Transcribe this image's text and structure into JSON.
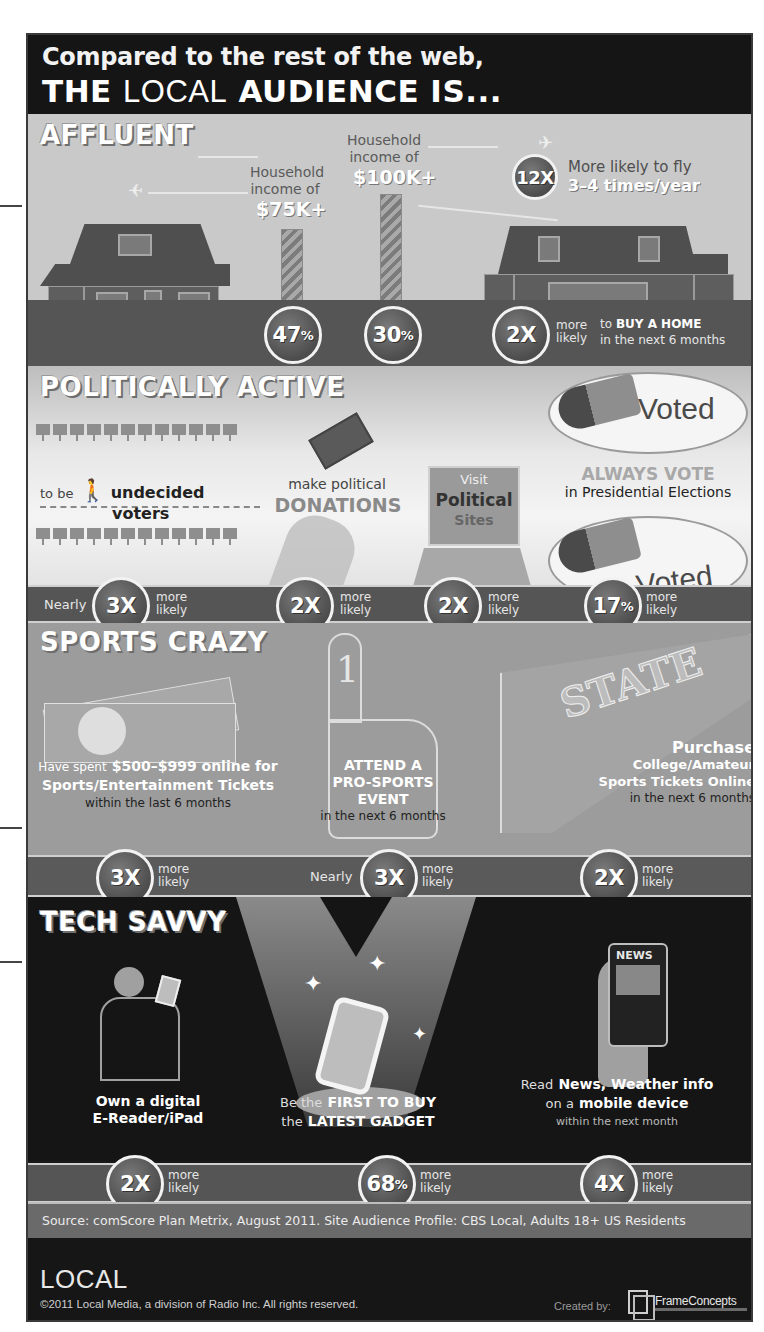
{
  "header": {
    "line1": "Compared to the rest of the web,",
    "line2_the": "THE",
    "line2_local": "LOCAL",
    "line2_rest": "AUDIENCE IS..."
  },
  "affluent": {
    "title": "AFFLUENT",
    "income75": {
      "label1": "Household",
      "label2": "income of",
      "value": "$75K+",
      "stat": "47",
      "unit": "%"
    },
    "income100": {
      "label1": "Household",
      "label2": "income of",
      "value": "$100K+",
      "stat": "30",
      "unit": "%"
    },
    "fly": {
      "stat": "12X",
      "label1": "More likely to fly",
      "label2": "3–4 times/year"
    },
    "home": {
      "stat": "2X",
      "more": "more",
      "likely": "likely",
      "text1_pre": "to",
      "text1_bold": "BUY A HOME",
      "text2": "in the next 6 months"
    }
  },
  "political": {
    "title": "POLITICALLY ACTIVE",
    "undecided": {
      "pre": "to be",
      "bold1": "undecided",
      "bold2": "voters",
      "prefix": "Nearly",
      "stat": "3X",
      "more": "more",
      "likely": "likely"
    },
    "donations": {
      "line1": "make political",
      "line2": "DONATIONS",
      "stat": "2X",
      "more": "more",
      "likely": "likely"
    },
    "sites": {
      "line1": "Visit",
      "line2": "Political",
      "line3": "Sites",
      "stat": "2X",
      "more": "more",
      "likely": "likely"
    },
    "vote": {
      "line1": "ALWAYS VOTE",
      "line2": "in Presidential Elections",
      "sticker_label": "Voted",
      "stat": "17",
      "unit": "%",
      "more": "more",
      "likely": "likely"
    }
  },
  "sports": {
    "title": "SPORTS CRAZY",
    "tickets": {
      "pre": "Have spent",
      "bold1": "$500–$999 online for",
      "bold2": "Sports/Entertainment Tickets",
      "line3": "within the last 6 months",
      "stat": "3X",
      "more": "more",
      "likely": "likely"
    },
    "event": {
      "finger_number": "1",
      "bold1": "ATTEND A",
      "bold2": "PRO-SPORTS",
      "bold3": "EVENT",
      "line4": "in the next 6 months",
      "prefix": "Nearly",
      "stat": "3X",
      "more": "more",
      "likely": "likely"
    },
    "college": {
      "pennant_text": "STATE",
      "bold1": "Purchase",
      "bold2": "College/Amateur",
      "bold3": "Sports Tickets Online",
      "line4": "in the next 6 months",
      "stat": "2X",
      "more": "more",
      "likely": "likely"
    }
  },
  "tech": {
    "title": "TECH SAVVY",
    "ereader": {
      "bold1": "Own a digital",
      "bold2": "E-Reader/iPad",
      "stat": "2X",
      "more": "more",
      "likely": "likely"
    },
    "gadget": {
      "pre1": "Be the",
      "bold1": "FIRST TO BUY",
      "pre2": "the",
      "bold2": "LATEST GADGET",
      "stat": "68",
      "unit": "%",
      "more": "more",
      "likely": "likely"
    },
    "news": {
      "phone_label": "NEWS",
      "pre1": "Read",
      "bold1": "News, Weather info",
      "pre2": "on a",
      "bold2": "mobile device",
      "line3": "within the next month",
      "stat": "4X",
      "more": "more",
      "likely": "likely"
    }
  },
  "source": "Source:  comScore Plan Metrix, August 2011. Site Audience Profile: CBS Local, Adults 18+ US Residents",
  "footer": {
    "logo": "LOCAL",
    "copyright": "©2011 Local Media, a division of Radio Inc. All rights reserved.",
    "created_by": "Created by:",
    "creator": "FrameConcepts"
  },
  "colors": {
    "header_bg": "#151515",
    "affluent_bg": "#c9c9c9",
    "band": "#555555",
    "sports_bg": "#9c9c9c",
    "tech_bg": "#151515",
    "source_band": "#6a6a6a"
  }
}
